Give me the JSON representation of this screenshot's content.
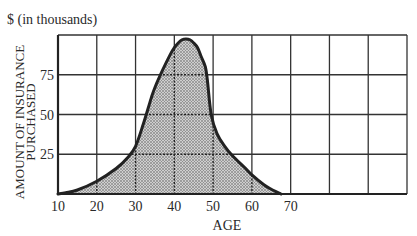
{
  "chart_data": {
    "type": "area",
    "title": "",
    "unit_label": "$ (in thousands)",
    "xlabel": "AGE",
    "ylabel_lines": [
      "AMOUNT OF INSURANCE",
      "PURCHASED"
    ],
    "xlim": [
      10,
      100
    ],
    "ylim": [
      0,
      100
    ],
    "x_ticks": [
      10,
      20,
      30,
      40,
      50,
      60,
      70
    ],
    "x_tick_labels": [
      "10",
      "20",
      "30",
      "40",
      "50",
      "60",
      "70"
    ],
    "y_ticks": [
      25,
      50,
      75
    ],
    "y_tick_labels": [
      "25",
      "50",
      "75"
    ],
    "grid": true,
    "grid_x_step": 10,
    "grid_y_step": 25,
    "legend": "none",
    "series": [
      {
        "name": "Amount of insurance purchased",
        "fill": "stippled gray",
        "x": [
          10,
          12,
          15,
          20,
          25,
          28,
          30,
          32,
          34,
          35,
          37,
          39,
          40,
          41,
          42,
          43,
          44,
          45,
          46,
          47,
          48,
          48.5,
          49.5,
          51,
          53,
          55,
          58,
          60,
          63,
          65,
          67.5
        ],
        "y": [
          0,
          0.8,
          2.5,
          8,
          16,
          23,
          30,
          44,
          60,
          67,
          78,
          88,
          92,
          95,
          97,
          97.5,
          97,
          95,
          92,
          86,
          80,
          72,
          50,
          38,
          30,
          24,
          17,
          12,
          6,
          3,
          0
        ]
      }
    ],
    "colors": {
      "curve": "#222222",
      "grid": "#333333",
      "fill_base": "#c9c9c9",
      "fill_dot": "#555555"
    }
  }
}
